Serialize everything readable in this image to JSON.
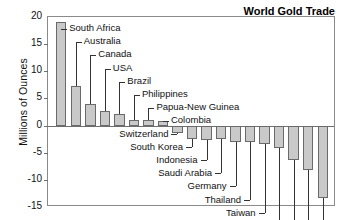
{
  "chart_data": {
    "type": "bar",
    "title": "World Gold Trade",
    "xlabel": "",
    "ylabel": "Millions of Ounces",
    "ylim": [
      -15,
      20
    ],
    "yticks": [
      20,
      15,
      10,
      5,
      0,
      -5,
      -10,
      -15
    ],
    "ytick_labels": [
      "20",
      "15",
      "10",
      "5",
      "0",
      "-5",
      "-10",
      "-15"
    ],
    "grid": false,
    "legend": "none",
    "categories": [
      "South Africa",
      "Australia",
      "Canada",
      "USA",
      "Brazil",
      "Philippines",
      "Papua-New Guinea",
      "Colombia",
      "Switzerland",
      "South Korea",
      "Indonesia",
      "Saudi Arabia",
      "Germany",
      "Thailand",
      "Taiwan",
      "Turkey",
      "Japan",
      "India",
      "Italy"
    ],
    "values": [
      19.0,
      7.3,
      4.0,
      2.7,
      2.1,
      1.0,
      1.0,
      0.8,
      -1.3,
      -2.4,
      -2.7,
      -2.5,
      -3.0,
      -3.0,
      -3.4,
      -4.1,
      -6.3,
      -8.2,
      -13.3
    ],
    "units": "Millions of Ounces",
    "bar_color": "#c9c9c9",
    "bar_border_color": "#6a6a6a",
    "axis_color": "#6e6e6e",
    "frame_color": "#8a8a8a",
    "note": "Positive values = exporters (producers); negative values = importers (consumers)"
  }
}
